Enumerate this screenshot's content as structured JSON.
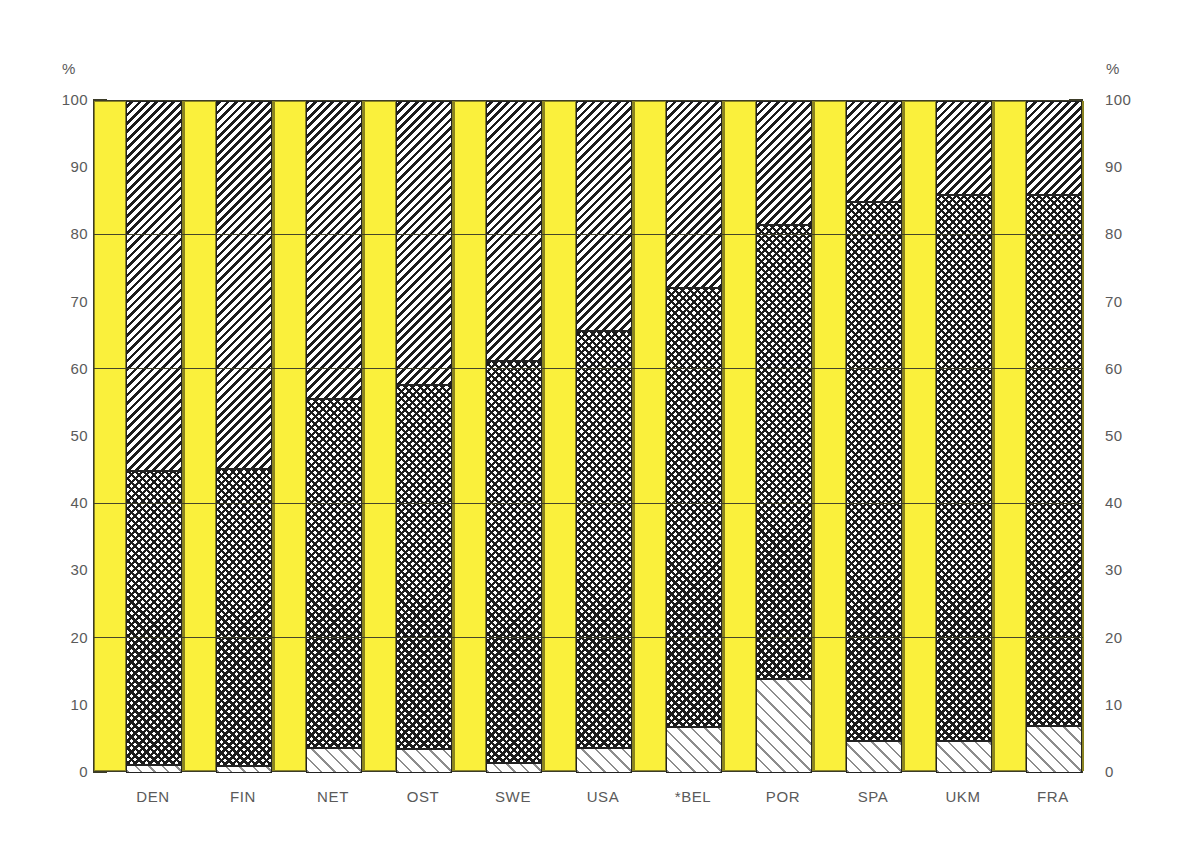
{
  "axis": {
    "unit_left": "%",
    "unit_right": "%",
    "ticks": [
      "100",
      "90",
      "80",
      "70",
      "60",
      "50",
      "40",
      "30",
      "20",
      "10",
      "0"
    ]
  },
  "chart_data": {
    "type": "bar",
    "title": "",
    "xlabel": "",
    "ylabel": "%",
    "ylim": [
      0,
      100
    ],
    "grid": true,
    "legend_position": "none",
    "stacked": true,
    "stack_total": 100,
    "categories": [
      "DEN",
      "FIN",
      "NET",
      "OST",
      "SWE",
      "USA",
      "*BEL",
      "POR",
      "SPA",
      "UKM",
      "FRA"
    ],
    "series": [
      {
        "name": "bottom-light-hatch",
        "pattern": "light diagonal hatch",
        "values": [
          1.2,
          1.0,
          3.7,
          3.5,
          1.5,
          3.7,
          6.8,
          14.0,
          4.8,
          4.8,
          7.0
        ]
      },
      {
        "name": "middle-checker",
        "pattern": "checkerboard",
        "values": [
          43.8,
          44.2,
          52.0,
          54.2,
          59.8,
          62.1,
          65.4,
          67.5,
          80.2,
          81.2,
          79.0
        ]
      },
      {
        "name": "top-dense-hatch",
        "pattern": "dense diagonal hatch",
        "values": [
          55.0,
          54.8,
          44.3,
          42.3,
          38.7,
          34.2,
          27.8,
          18.5,
          15.0,
          14.0,
          14.0
        ]
      }
    ],
    "cumulative_boundaries": {
      "bottom_top_edge": [
        1.2,
        1.0,
        3.7,
        3.5,
        1.5,
        3.7,
        6.8,
        14.0,
        4.8,
        4.8,
        7.0
      ],
      "middle_top_edge": [
        45.0,
        45.2,
        55.7,
        57.7,
        61.3,
        65.8,
        72.2,
        81.5,
        85.0,
        86.0,
        86.0
      ]
    }
  },
  "style": {
    "band_color": "#faf03c",
    "band_border": "#8a8322",
    "segment_border": "#232323",
    "axis_color": "#3c3c28",
    "text_color": "#5a5a5a",
    "background": "#ffffff"
  }
}
